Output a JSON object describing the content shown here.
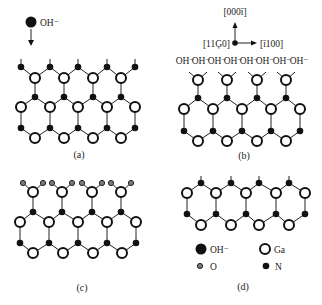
{
  "figure": {
    "panels": [
      {
        "id": "a",
        "label": "(a)",
        "description": "OH- approaching N-terminated surface"
      },
      {
        "id": "b",
        "label": "(b)",
        "description": "OH- adsorbed on Ga-terminated surface"
      },
      {
        "id": "c",
        "label": "(c)",
        "description": "O atoms bonded to surface Ga"
      },
      {
        "id": "d",
        "label": "(d)",
        "description": "N-terminated surface after etching"
      }
    ],
    "panel_a": {
      "incoming_species": "OH⁻"
    },
    "panel_b": {
      "axes": {
        "up": "[000ī]",
        "right": "[ī100]",
        "origin": "[11Ģ0]"
      },
      "surface_labels": [
        "OH⁻",
        "OH⁻",
        "OH⁻",
        "OH⁻",
        "OH⁻",
        "OH⁻",
        "OH⁻",
        "OH⁻"
      ]
    },
    "legend": {
      "items": [
        {
          "symbol": "large-black-circle",
          "label": "OH⁻"
        },
        {
          "symbol": "open-circle",
          "label": "Ga"
        },
        {
          "symbol": "small-gray-circle",
          "label": "O"
        },
        {
          "symbol": "small-black-circle",
          "label": "N"
        }
      ]
    },
    "colors": {
      "atom_outline": "#111111",
      "n_atom": "#111111",
      "o_atom": "#7a7a7a",
      "ga_atom": "#ffffff",
      "background": "#ffffff"
    }
  }
}
